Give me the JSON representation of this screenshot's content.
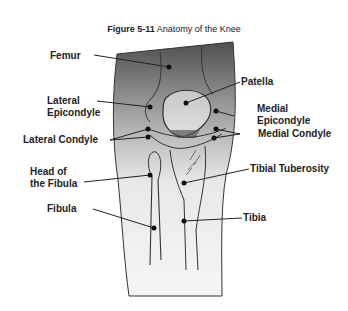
{
  "figure": {
    "number": "Figure 5-11",
    "caption": "Anatomy of the Knee"
  },
  "labels": {
    "femur": "Femur",
    "lateral_epicondyle_1": "Lateral",
    "lateral_epicondyle_2": "Epicondyle",
    "lateral_condyle": "Lateral Condyle",
    "head_fibula_1": "Head of",
    "head_fibula_2": "the Fibula",
    "fibula": "Fibula",
    "patella": "Patella",
    "medial_epicondyle_1": "Medial",
    "medial_epicondyle_2": "Epicondyle",
    "medial_condyle": "Medial Condyle",
    "tibial_tuberosity": "Tibial Tuberosity",
    "tibia": "Tibia"
  },
  "colors": {
    "leg_top": "#555555",
    "leg_bottom": "#f4f4f4",
    "line": "#222222"
  }
}
